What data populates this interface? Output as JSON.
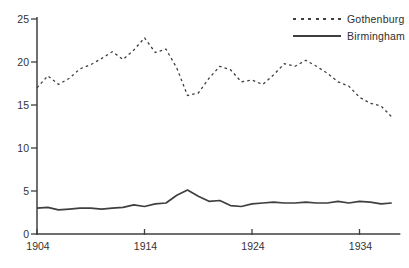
{
  "figure": {
    "background": "#ffffff",
    "line_color": "#3f3f3f",
    "text_color": "#333333"
  },
  "chart_data": {
    "type": "line",
    "title": "",
    "xlabel": "",
    "ylabel": "",
    "x": [
      1904,
      1905,
      1906,
      1907,
      1908,
      1909,
      1910,
      1911,
      1912,
      1913,
      1914,
      1915,
      1916,
      1917,
      1918,
      1919,
      1920,
      1921,
      1922,
      1923,
      1924,
      1925,
      1926,
      1927,
      1928,
      1929,
      1930,
      1931,
      1932,
      1933,
      1934,
      1935,
      1936,
      1937
    ],
    "series": [
      {
        "name": "Gothenburg",
        "style": "dotted",
        "values": [
          17.0,
          18.4,
          17.4,
          18.1,
          19.2,
          19.7,
          20.4,
          21.2,
          20.3,
          21.4,
          22.8,
          21.1,
          21.5,
          19.3,
          16.1,
          16.4,
          18.1,
          19.5,
          19.1,
          17.7,
          17.9,
          17.4,
          18.5,
          19.8,
          19.5,
          20.2,
          19.5,
          18.7,
          17.7,
          17.2,
          15.9,
          15.2,
          14.9,
          13.6
        ]
      },
      {
        "name": "Birmingham",
        "style": "solid",
        "values": [
          3.0,
          3.1,
          2.8,
          2.9,
          3.0,
          3.0,
          2.9,
          3.0,
          3.1,
          3.4,
          3.2,
          3.5,
          3.6,
          4.5,
          5.1,
          4.4,
          3.8,
          3.9,
          3.3,
          3.2,
          3.5,
          3.6,
          3.7,
          3.6,
          3.6,
          3.7,
          3.6,
          3.6,
          3.8,
          3.6,
          3.8,
          3.7,
          3.5,
          3.6
        ]
      }
    ],
    "xticks": [
      1904,
      1914,
      1924,
      1934
    ],
    "yticks": [
      0,
      5,
      10,
      15,
      20,
      25
    ],
    "xlim": [
      1904,
      1937.8
    ],
    "ylim": [
      0,
      25
    ],
    "grid": false,
    "legend_position": "top-right"
  }
}
